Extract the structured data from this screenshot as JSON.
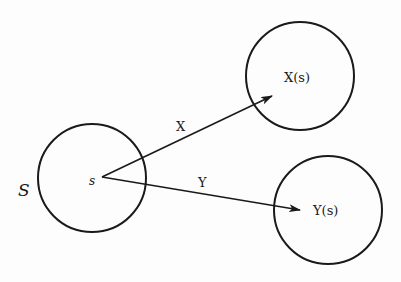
{
  "diagram": {
    "type": "mapping-diagram",
    "sets": [
      {
        "id": "S",
        "label": "S",
        "element_label": "s",
        "cx": 92,
        "cy": 178,
        "r": 54
      },
      {
        "id": "Xs",
        "label": "X(s)",
        "cx": 300,
        "cy": 76,
        "r": 54
      },
      {
        "id": "Ys",
        "label": "Y(s)",
        "cx": 328,
        "cy": 210,
        "r": 54
      }
    ],
    "arrows": [
      {
        "id": "X",
        "label": "X",
        "from": [
          102,
          177
        ],
        "to": [
          272,
          96
        ]
      },
      {
        "id": "Y",
        "label": "Y",
        "from": [
          102,
          177
        ],
        "to": [
          300,
          210
        ]
      }
    ],
    "colors": {
      "stroke": "#1a1a1a",
      "background": "#fdfdfd"
    }
  }
}
